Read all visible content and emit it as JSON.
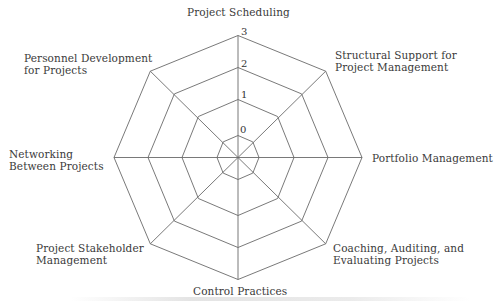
{
  "chart_data": {
    "type": "radar",
    "title": "",
    "axes": [
      "Project Scheduling",
      "Structural Support for Project Management",
      "Portfolio Management",
      "Coaching, Auditing, and Evaluating Projects",
      "Control Practices",
      "Project Stakeholder Management",
      "Networking Between Projects",
      "Personnel Development for Projects"
    ],
    "scale": {
      "min": 0,
      "max": 3,
      "ticks": [
        "0",
        "1",
        "2",
        "3"
      ]
    },
    "grid": true,
    "series": [],
    "legend": null
  },
  "labels": {
    "top": "Project Scheduling",
    "top_right_line1": "Structural Support for",
    "top_right_line2": "Project Management",
    "right": "Portfolio Management",
    "bottom_right_line1": "Coaching, Auditing, and",
    "bottom_right_line2": "Evaluating Projects",
    "bottom": "Control Practices",
    "bottom_left_line1": "Project Stakeholder",
    "bottom_left_line2": "Management",
    "left_line1": "Networking",
    "left_line2": "Between Projects",
    "top_left_line1": "Personnel Development",
    "top_left_line2": "for Projects"
  },
  "ticks": {
    "t0": "0",
    "t1": "1",
    "t2": "2",
    "t3": "3"
  },
  "colors": {
    "grid": "#666666",
    "text": "#3a3a3a"
  }
}
